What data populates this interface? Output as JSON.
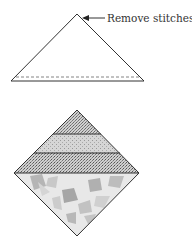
{
  "annotation": {
    "text": "Remove stitches."
  },
  "figures": {
    "top": {
      "name": "triangle-unit",
      "description": "Triangle with stitch line along base"
    },
    "bottom": {
      "name": "pieced-square-on-point",
      "description": "Square on point with three textured strips and a mottled triangle"
    }
  },
  "colors": {
    "line": "#333333",
    "stripe_dark": "#9a9a9a",
    "stripe_light": "#c6c6c6",
    "mottle_base": "#e6e6e6",
    "mottle_dark": "#a8a8a8"
  }
}
